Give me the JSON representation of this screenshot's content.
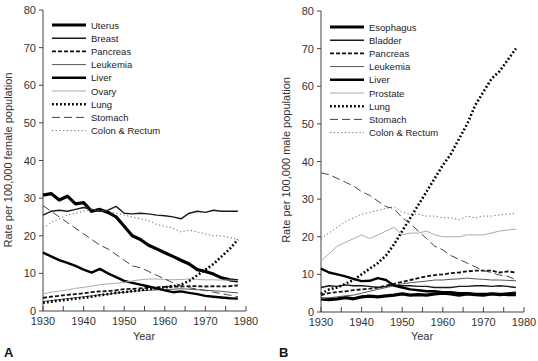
{
  "chart_data": [
    {
      "type": "line",
      "panel": "A",
      "title": "",
      "xlabel": "Year",
      "ylabel": "Rate per 100,000 female population",
      "xlim": [
        1930,
        1980
      ],
      "ylim": [
        0,
        80
      ],
      "xticks": [
        1930,
        1940,
        1950,
        1960,
        1970,
        1980
      ],
      "yticks": [
        0,
        10,
        20,
        30,
        40,
        50,
        60,
        70,
        80
      ],
      "grid": false,
      "legend_position": "upper-left",
      "x": [
        1930,
        1932,
        1934,
        1936,
        1938,
        1940,
        1942,
        1944,
        1946,
        1948,
        1950,
        1952,
        1954,
        1956,
        1958,
        1960,
        1962,
        1964,
        1966,
        1968,
        1970,
        1972,
        1974,
        1976,
        1978
      ],
      "series": [
        {
          "name": "Uterus",
          "style": "thick",
          "values": [
            30.8,
            31.2,
            29.5,
            30.5,
            28.5,
            28.8,
            26.5,
            27.0,
            26.2,
            25.0,
            22.5,
            20.0,
            19.0,
            17.5,
            16.5,
            15.5,
            14.5,
            13.5,
            12.5,
            11.0,
            10.5,
            9.8,
            8.8,
            8.3,
            8.0
          ]
        },
        {
          "name": "Breast",
          "style": "medium",
          "values": [
            25.5,
            26.5,
            26.8,
            26.5,
            27.0,
            27.5,
            27.0,
            26.5,
            26.8,
            27.8,
            26.0,
            25.8,
            26.0,
            25.8,
            25.5,
            25.3,
            25.0,
            24.5,
            26.0,
            26.5,
            26.2,
            26.8,
            26.5,
            26.5,
            26.5
          ]
        },
        {
          "name": "Pancreas",
          "style": "dashed-thick",
          "values": [
            3.5,
            3.8,
            4.0,
            4.3,
            4.5,
            4.7,
            5.0,
            5.2,
            5.3,
            5.5,
            5.8,
            5.9,
            6.0,
            6.2,
            6.3,
            6.4,
            6.5,
            6.5,
            6.6,
            6.6,
            6.5,
            6.6,
            6.5,
            6.6,
            6.8
          ]
        },
        {
          "name": "Leukemia",
          "style": "thin",
          "values": [
            2.5,
            2.8,
            3.0,
            3.3,
            3.5,
            3.8,
            4.0,
            4.3,
            4.5,
            4.8,
            5.0,
            5.2,
            5.4,
            5.5,
            5.6,
            5.7,
            5.8,
            5.9,
            5.8,
            5.7,
            5.5,
            5.4,
            5.2,
            5.0,
            4.8
          ]
        },
        {
          "name": "Liver",
          "style": "thick-solid",
          "values": [
            15.5,
            14.5,
            13.5,
            12.8,
            12.0,
            11.0,
            10.2,
            11.2,
            10.0,
            9.0,
            8.0,
            7.5,
            7.0,
            6.5,
            6.0,
            5.5,
            5.0,
            5.2,
            4.8,
            4.5,
            4.0,
            3.8,
            3.6,
            3.4,
            3.3
          ]
        },
        {
          "name": "Ovary",
          "style": "light",
          "values": [
            4.5,
            5.0,
            5.3,
            5.6,
            6.0,
            6.3,
            6.6,
            7.0,
            7.2,
            7.4,
            7.6,
            8.0,
            8.3,
            8.5,
            8.5,
            8.4,
            8.3,
            8.4,
            8.5,
            8.4,
            8.3,
            8.3,
            8.2,
            8.2,
            8.1
          ]
        },
        {
          "name": "Lung",
          "style": "dotted-thick",
          "values": [
            2.2,
            2.5,
            2.8,
            3.0,
            3.3,
            3.5,
            3.8,
            4.2,
            4.5,
            4.8,
            5.0,
            5.3,
            5.5,
            5.8,
            6.0,
            6.3,
            6.6,
            7.0,
            8.0,
            9.5,
            11.0,
            12.5,
            14.5,
            16.5,
            19.0
          ]
        },
        {
          "name": "Stomach",
          "style": "long-dash",
          "values": [
            28.0,
            26.5,
            25.0,
            23.5,
            22.0,
            20.5,
            19.0,
            17.5,
            16.5,
            15.0,
            13.5,
            12.0,
            11.5,
            10.5,
            9.5,
            8.5,
            7.5,
            6.8,
            6.2,
            5.8,
            5.5,
            5.0,
            4.6,
            4.2,
            3.8
          ]
        },
        {
          "name": "Colon & Rectum",
          "style": "dotted-thin",
          "values": [
            22.0,
            23.5,
            24.5,
            25.5,
            26.0,
            26.5,
            27.0,
            26.8,
            26.5,
            26.0,
            25.5,
            25.0,
            24.5,
            24.0,
            23.0,
            22.5,
            22.0,
            21.0,
            21.5,
            21.0,
            20.5,
            20.0,
            20.0,
            19.5,
            19.0
          ]
        }
      ]
    },
    {
      "type": "line",
      "panel": "B",
      "title": "",
      "xlabel": "Year",
      "ylabel": "Rate per 100,000 male population",
      "xlim": [
        1930,
        1980
      ],
      "ylim": [
        0,
        80
      ],
      "xticks": [
        1930,
        1940,
        1950,
        1960,
        1970,
        1980
      ],
      "yticks": [
        0,
        10,
        20,
        30,
        40,
        50,
        60,
        70,
        80
      ],
      "grid": false,
      "legend_position": "upper-left",
      "x": [
        1930,
        1932,
        1934,
        1936,
        1938,
        1940,
        1942,
        1944,
        1946,
        1948,
        1950,
        1952,
        1954,
        1956,
        1958,
        1960,
        1962,
        1964,
        1966,
        1968,
        1970,
        1972,
        1974,
        1976,
        1978
      ],
      "series": [
        {
          "name": "Esophagus",
          "style": "thick",
          "values": [
            3.5,
            3.3,
            3.5,
            3.8,
            3.5,
            4.0,
            4.2,
            4.0,
            4.3,
            4.5,
            4.8,
            4.5,
            4.6,
            4.5,
            4.8,
            5.0,
            4.8,
            4.5,
            4.8,
            4.6,
            4.5,
            4.8,
            4.6,
            4.8,
            5.0
          ]
        },
        {
          "name": "Bladder",
          "style": "medium",
          "values": [
            6.5,
            7.0,
            6.8,
            7.2,
            7.0,
            7.0,
            6.8,
            6.5,
            6.8,
            7.2,
            7.0,
            7.0,
            6.8,
            6.8,
            6.5,
            6.5,
            6.5,
            6.8,
            6.8,
            7.0,
            7.0,
            6.8,
            7.0,
            6.8,
            6.5
          ]
        },
        {
          "name": "Pancreas",
          "style": "dashed-thick",
          "values": [
            4.5,
            5.0,
            5.3,
            5.5,
            5.8,
            6.0,
            6.2,
            6.5,
            7.0,
            7.5,
            8.0,
            8.5,
            9.0,
            9.5,
            9.8,
            10.0,
            10.3,
            10.5,
            10.8,
            11.0,
            11.0,
            11.0,
            10.5,
            10.8,
            10.5
          ]
        },
        {
          "name": "Leukemia",
          "style": "thin",
          "values": [
            3.5,
            3.8,
            4.0,
            4.3,
            4.5,
            5.0,
            5.5,
            6.0,
            6.5,
            7.0,
            7.5,
            7.8,
            8.0,
            8.2,
            8.5,
            8.5,
            8.7,
            8.8,
            9.0,
            8.8,
            8.7,
            8.5,
            8.5,
            8.4,
            8.3
          ]
        },
        {
          "name": "Liver",
          "style": "thick-solid",
          "values": [
            11.5,
            10.5,
            10.0,
            9.5,
            8.8,
            8.2,
            8.3,
            9.0,
            8.5,
            7.0,
            6.5,
            6.0,
            5.8,
            5.5,
            5.5,
            5.3,
            5.3,
            5.0,
            5.0,
            4.8,
            4.8,
            4.8,
            4.8,
            4.5,
            4.5
          ]
        },
        {
          "name": "Prostate",
          "style": "light",
          "values": [
            13.5,
            15.5,
            17.5,
            18.5,
            19.5,
            20.5,
            19.5,
            20.5,
            21.5,
            22.5,
            20.5,
            21.0,
            21.0,
            21.5,
            20.5,
            20.0,
            20.0,
            20.0,
            20.5,
            20.5,
            20.5,
            21.0,
            21.5,
            21.8,
            22.0
          ]
        },
        {
          "name": "Lung",
          "style": "dotted-thick",
          "values": [
            4.8,
            6.0,
            6.5,
            7.5,
            8.5,
            10.0,
            11.5,
            13.0,
            15.0,
            18.0,
            21.5,
            25.0,
            28.5,
            32.0,
            35.5,
            39.0,
            42.0,
            46.0,
            50.0,
            55.0,
            58.5,
            62.0,
            64.0,
            67.0,
            70.0
          ]
        },
        {
          "name": "Stomach",
          "style": "long-dash",
          "values": [
            37.0,
            36.5,
            35.5,
            34.5,
            33.5,
            32.0,
            31.0,
            29.5,
            28.0,
            27.5,
            25.0,
            23.5,
            21.5,
            19.5,
            17.5,
            16.5,
            15.0,
            14.0,
            13.0,
            12.0,
            11.0,
            10.5,
            9.8,
            9.5,
            8.5
          ]
        },
        {
          "name": "Colon & Rectum",
          "style": "dotted-thin",
          "values": [
            19.5,
            21.0,
            22.5,
            24.0,
            25.0,
            26.0,
            26.5,
            27.0,
            27.5,
            28.0,
            26.5,
            26.0,
            26.0,
            25.5,
            25.5,
            25.0,
            25.0,
            24.5,
            25.5,
            25.0,
            25.5,
            25.5,
            25.8,
            26.0,
            26.2
          ]
        }
      ]
    }
  ],
  "panels": {
    "a": {
      "label": "A",
      "xlabel": "Year",
      "ylabel": "Rate per 100,000 female population",
      "legend": [
        "Uterus",
        "Breast",
        "Pancreas",
        "Leukemia",
        "Liver",
        "Ovary",
        "Lung",
        "Stomach",
        "Colon & Rectum"
      ]
    },
    "b": {
      "label": "B",
      "xlabel": "Year",
      "ylabel": "Rate per 100,000 male population",
      "legend": [
        "Esophagus",
        "Bladder",
        "Pancreas",
        "Leukemia",
        "Liver",
        "Prostate",
        "Lung",
        "Stomach",
        "Colon & Rectum"
      ]
    }
  },
  "styles": {
    "thick": {
      "stroke": "#000000",
      "width": 3.2,
      "dash": ""
    },
    "medium": {
      "stroke": "#1a1a1a",
      "width": 1.4,
      "dash": ""
    },
    "dashed-thick": {
      "stroke": "#111111",
      "width": 1.8,
      "dash": "4,2"
    },
    "thin": {
      "stroke": "#555555",
      "width": 1.0,
      "dash": ""
    },
    "thick-solid": {
      "stroke": "#000000",
      "width": 2.4,
      "dash": ""
    },
    "light": {
      "stroke": "#aaaaaa",
      "width": 1.0,
      "dash": ""
    },
    "dotted-thick": {
      "stroke": "#000000",
      "width": 2.6,
      "dash": "1.8,2.2"
    },
    "long-dash": {
      "stroke": "#444444",
      "width": 1.0,
      "dash": "8,4"
    },
    "dotted-thin": {
      "stroke": "#666666",
      "width": 1.0,
      "dash": "1.2,2.5"
    }
  }
}
